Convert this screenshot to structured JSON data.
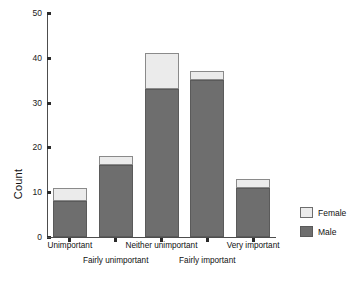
{
  "chart_data": {
    "type": "bar",
    "subtype": "stacked-vertical",
    "title": "",
    "xlabel": "",
    "ylabel": "Count",
    "ylim": [
      0,
      50
    ],
    "yticks": [
      0,
      10,
      20,
      30,
      40,
      50
    ],
    "ytick_labels": [
      "0",
      "10",
      "20",
      "30",
      "40",
      "50"
    ],
    "grid": false,
    "categories": [
      "Unimportant",
      "Fairly unimportant",
      "Neither unimportant",
      "Fairly important",
      "Very important"
    ],
    "series": [
      {
        "name": "Male",
        "color": "#6e6e6e",
        "values": [
          8,
          16,
          33,
          35,
          11
        ]
      },
      {
        "name": "Female",
        "color": "#ebebeb",
        "values": [
          3,
          2,
          8,
          2,
          2
        ]
      }
    ],
    "totals": [
      11,
      18,
      41,
      37,
      13
    ],
    "legend": {
      "position": "right",
      "entries": [
        {
          "label": "Female",
          "color": "#ebebeb"
        },
        {
          "label": "Male",
          "color": "#6e6e6e"
        }
      ]
    },
    "axis_color": "#4d4d4d",
    "background": "#ffffff"
  }
}
